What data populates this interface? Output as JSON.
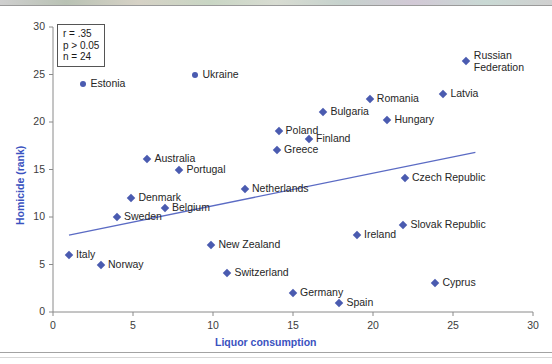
{
  "chart_data": {
    "type": "scatter",
    "title": "",
    "xlabel": "Liquor consumption",
    "ylabel": "Homicide (rank)",
    "xlim": [
      0,
      30
    ],
    "ylim": [
      0,
      30
    ],
    "xticks": [
      0,
      5,
      10,
      15,
      20,
      25,
      30
    ],
    "yticks": [
      0,
      5,
      10,
      15,
      20,
      25,
      30
    ],
    "grid": false,
    "legend": "none",
    "annotation": {
      "r": "r = .35",
      "p": "p > 0.05",
      "n": "n = 24"
    },
    "trendline": {
      "label": "linear-fit",
      "x_start": 1.0,
      "y_start": 8.1,
      "x_end": 26.4,
      "y_end": 16.8
    },
    "points": [
      {
        "label": "Estonia",
        "x": 1.9,
        "y": 24.0,
        "marker": "circle",
        "label_side": "right"
      },
      {
        "label": "Ukraine",
        "x": 8.9,
        "y": 25.0,
        "marker": "circle",
        "label_side": "right"
      },
      {
        "label": "Russian Federation",
        "x": 25.8,
        "y": 26.4,
        "marker": "diamond",
        "label_side": "right"
      },
      {
        "label": "Latvia",
        "x": 24.4,
        "y": 23.0,
        "marker": "diamond",
        "label_side": "right"
      },
      {
        "label": "Romania",
        "x": 19.8,
        "y": 22.4,
        "marker": "diamond",
        "label_side": "right"
      },
      {
        "label": "Bulgaria",
        "x": 16.9,
        "y": 21.1,
        "marker": "diamond",
        "label_side": "right"
      },
      {
        "label": "Hungary",
        "x": 20.9,
        "y": 20.2,
        "marker": "diamond",
        "label_side": "right"
      },
      {
        "label": "Poland",
        "x": 14.1,
        "y": 19.1,
        "marker": "diamond",
        "label_side": "right"
      },
      {
        "label": "Finland",
        "x": 16.0,
        "y": 18.2,
        "marker": "diamond",
        "label_side": "right"
      },
      {
        "label": "Greece",
        "x": 14.0,
        "y": 17.1,
        "marker": "diamond",
        "label_side": "right"
      },
      {
        "label": "Australia",
        "x": 5.9,
        "y": 16.1,
        "marker": "diamond",
        "label_side": "right"
      },
      {
        "label": "Portugal",
        "x": 7.9,
        "y": 15.0,
        "marker": "diamond",
        "label_side": "right"
      },
      {
        "label": "Czech Republic",
        "x": 22.0,
        "y": 14.1,
        "marker": "diamond",
        "label_side": "right"
      },
      {
        "label": "Netherlands",
        "x": 12.0,
        "y": 13.0,
        "marker": "diamond",
        "label_side": "right"
      },
      {
        "label": "Denmark",
        "x": 4.9,
        "y": 12.0,
        "marker": "diamond",
        "label_side": "right"
      },
      {
        "label": "Belgium",
        "x": 7.0,
        "y": 11.0,
        "marker": "diamond",
        "label_side": "right"
      },
      {
        "label": "Sweden",
        "x": 4.0,
        "y": 10.0,
        "marker": "diamond",
        "label_side": "right"
      },
      {
        "label": "Slovak Republic",
        "x": 21.9,
        "y": 9.2,
        "marker": "diamond",
        "label_side": "right"
      },
      {
        "label": "Ireland",
        "x": 19.0,
        "y": 8.1,
        "marker": "diamond",
        "label_side": "right"
      },
      {
        "label": "New Zealand",
        "x": 9.9,
        "y": 7.1,
        "marker": "diamond",
        "label_side": "right"
      },
      {
        "label": "Italy",
        "x": 1.0,
        "y": 6.0,
        "marker": "diamond",
        "label_side": "right"
      },
      {
        "label": "Norway",
        "x": 3.0,
        "y": 5.0,
        "marker": "diamond",
        "label_side": "right"
      },
      {
        "label": "Switzerland",
        "x": 10.9,
        "y": 4.1,
        "marker": "diamond",
        "label_side": "right"
      },
      {
        "label": "Cyprus",
        "x": 23.9,
        "y": 3.1,
        "marker": "diamond",
        "label_side": "right"
      },
      {
        "label": "Germany",
        "x": 15.0,
        "y": 2.0,
        "marker": "diamond",
        "label_side": "right"
      },
      {
        "label": "Spain",
        "x": 17.9,
        "y": 1.0,
        "marker": "diamond",
        "label_side": "right"
      }
    ],
    "colors": {
      "marker": "#4a5bb0",
      "trendline": "#5b6bc4",
      "axis": "#8a8a8a",
      "axis_title": "#3a52c0",
      "tick_label": "#3c3c3c",
      "point_label": "#262626"
    }
  }
}
